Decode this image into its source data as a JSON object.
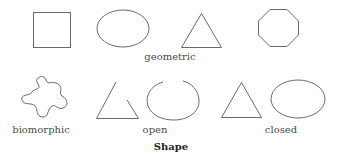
{
  "figure": {
    "title": "Shape",
    "groups": [
      {
        "label": "geometric",
        "shapes": [
          "square",
          "ellipse",
          "triangle",
          "octagon"
        ]
      },
      {
        "label": "biomorphic",
        "shapes": [
          "blob"
        ]
      },
      {
        "label": "open",
        "shapes": [
          "open-triangle",
          "open-ellipse"
        ]
      },
      {
        "label": "closed",
        "shapes": [
          "triangle",
          "ellipse"
        ]
      }
    ],
    "stroke_color": "#6a6a6a",
    "text_color": "#4a4a4a"
  }
}
